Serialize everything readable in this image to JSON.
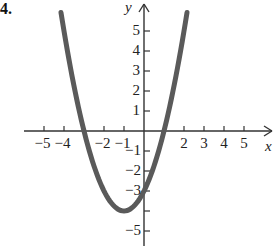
{
  "problem_label": "4.",
  "chart_data": {
    "type": "line",
    "title": "",
    "function": "y = x^2 + 2x - 3",
    "xlabel": "x",
    "ylabel": "y",
    "xlim": [
      -5.5,
      6
    ],
    "ylim": [
      -5.5,
      6
    ],
    "grid": false,
    "legend": null,
    "x_ticks": [
      -5,
      -4,
      -2,
      -1,
      2,
      3,
      4,
      5
    ],
    "x_tick_labels": [
      "−5",
      "−4",
      "−2",
      "−1",
      "2",
      "3",
      "4",
      "5"
    ],
    "y_ticks": [
      5,
      4,
      3,
      2,
      1,
      -1,
      -2,
      -3,
      -4,
      -5
    ],
    "y_tick_labels": [
      "5",
      "4",
      "3",
      "2",
      "1",
      "−1",
      "−2",
      "−3",
      "",
      "−5"
    ],
    "vertex": [
      -1,
      -4
    ],
    "x_intercepts": [
      -3,
      1
    ],
    "y_intercept": -3,
    "x_domain": [
      -4.15,
      2.15
    ],
    "series": [
      {
        "name": "parabola",
        "color": "#5a5a5a",
        "x": [
          -4.15,
          -4,
          -3.5,
          -3,
          -2.5,
          -2,
          -1.5,
          -1,
          -0.5,
          0,
          0.5,
          1,
          1.5,
          2,
          2.15
        ],
        "values": [
          6.92,
          5,
          2.25,
          0,
          -1.75,
          -3,
          -3.75,
          -4,
          -3.75,
          -3,
          -1.75,
          0,
          2.25,
          5,
          5.92
        ]
      }
    ]
  },
  "colors": {
    "axis": "#333333",
    "curve": "#5a5a5a",
    "text": "#222222"
  }
}
